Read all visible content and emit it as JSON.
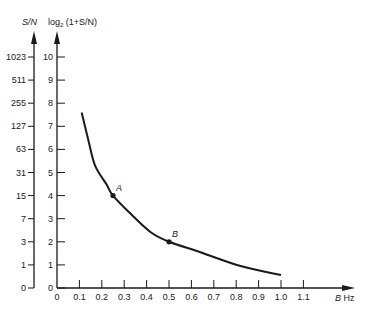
{
  "chart_data": {
    "type": "line",
    "title": "",
    "xlabel": "B Hz",
    "ylabel_left": "S/N",
    "ylabel_right": "log2 (1+S/N)",
    "xlim": [
      0,
      1.2
    ],
    "ylim": [
      0,
      10.5
    ],
    "grid": false,
    "legend": null,
    "x_ticks": [
      "0",
      "0.1",
      "0.2",
      "0.3",
      "0.4",
      "0.5",
      "0.6",
      "0.7",
      "0.8",
      "0.9",
      "1.0",
      "1.1"
    ],
    "y_ticks_log2": [
      "0",
      "1",
      "2",
      "3",
      "4",
      "5",
      "6",
      "7",
      "8",
      "9",
      "10"
    ],
    "y_ticks_sn": [
      "0",
      "1",
      "3",
      "7",
      "15",
      "31",
      "63",
      "127",
      "255",
      "511",
      "1023"
    ],
    "series": [
      {
        "name": "constant capacity curve",
        "x": [
          0.11,
          0.14,
          0.17,
          0.22,
          0.25,
          0.33,
          0.42,
          0.5,
          0.64,
          0.82,
          1.0
        ],
        "y": [
          7.6,
          6.4,
          5.3,
          4.5,
          4.0,
          3.2,
          2.4,
          2.0,
          1.55,
          0.95,
          0.56
        ]
      }
    ],
    "annotations": [
      {
        "label": "A",
        "x": 0.25,
        "y": 4
      },
      {
        "label": "B",
        "x": 0.5,
        "y": 2
      }
    ]
  },
  "labels": {
    "sn": "S/N",
    "log_prefix": "log",
    "log_sub": "2",
    "log_suffix": " (1+S/N)",
    "x_unit_var": "B",
    "x_unit": " Hz",
    "point_a": "A",
    "point_b": "B"
  },
  "colors": {
    "ink": "#1a1a1a",
    "background": "#ffffff"
  }
}
